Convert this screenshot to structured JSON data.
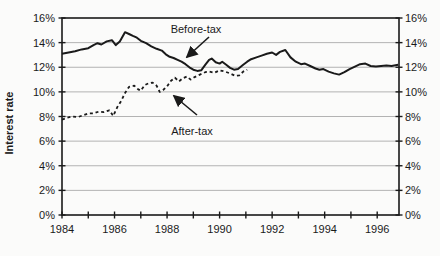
{
  "figure": {
    "background": "#fbfbfa",
    "frame_color": "#1a1a1a",
    "grid_color": "#b3b3b3",
    "line_color": "#1a1a1a"
  },
  "chart_data": {
    "type": "line",
    "title": "",
    "xlabel": "",
    "ylabel": "Interest rate",
    "xlim": [
      1984,
      1996.83
    ],
    "ylim": [
      0,
      16
    ],
    "grid": "horizontal gridlines at every 2% (light gray); full black frame; tick marks cross the axes",
    "legend": "none; series identified by in-plot text annotations with arrows",
    "y_ticks": [
      0,
      2,
      4,
      6,
      8,
      10,
      12,
      14,
      16
    ],
    "y_tick_labels": [
      "0%",
      "2%",
      "4%",
      "6%",
      "8%",
      "10%",
      "12%",
      "14%",
      "16%"
    ],
    "y_axis_sides": "both left and right",
    "x_ticks_minor": [
      1984,
      1985,
      1986,
      1987,
      1988,
      1989,
      1990,
      1991,
      1992,
      1993,
      1994,
      1995,
      1996
    ],
    "x_tick_labels": [
      "1984",
      "1986",
      "1988",
      "1990",
      "1992",
      "1994",
      "1996"
    ],
    "x_label_years": [
      1984,
      1986,
      1988,
      1990,
      1992,
      1994,
      1996
    ],
    "series": [
      {
        "name": "Before-tax",
        "style": "solid",
        "stroke_width": 2,
        "color": "#1a1a1a",
        "points": [
          [
            1984.0,
            13.1
          ],
          [
            1984.25,
            13.2
          ],
          [
            1984.5,
            13.3
          ],
          [
            1984.75,
            13.45
          ],
          [
            1985.0,
            13.55
          ],
          [
            1985.2,
            13.8
          ],
          [
            1985.35,
            13.95
          ],
          [
            1985.5,
            13.85
          ],
          [
            1985.7,
            14.1
          ],
          [
            1985.9,
            14.2
          ],
          [
            1986.05,
            13.8
          ],
          [
            1986.2,
            14.1
          ],
          [
            1986.4,
            14.85
          ],
          [
            1986.55,
            14.7
          ],
          [
            1986.7,
            14.55
          ],
          [
            1986.85,
            14.4
          ],
          [
            1987.0,
            14.15
          ],
          [
            1987.2,
            13.95
          ],
          [
            1987.4,
            13.7
          ],
          [
            1987.6,
            13.5
          ],
          [
            1987.8,
            13.35
          ],
          [
            1987.95,
            13.05
          ],
          [
            1988.1,
            12.85
          ],
          [
            1988.25,
            12.75
          ],
          [
            1988.4,
            12.6
          ],
          [
            1988.55,
            12.45
          ],
          [
            1988.7,
            12.25
          ],
          [
            1988.85,
            12.0
          ],
          [
            1989.0,
            11.8
          ],
          [
            1989.15,
            11.7
          ],
          [
            1989.3,
            11.75
          ],
          [
            1989.45,
            12.2
          ],
          [
            1989.6,
            12.6
          ],
          [
            1989.7,
            12.7
          ],
          [
            1989.85,
            12.4
          ],
          [
            1990.0,
            12.3
          ],
          [
            1990.1,
            12.45
          ],
          [
            1990.25,
            12.2
          ],
          [
            1990.4,
            11.95
          ],
          [
            1990.55,
            11.8
          ],
          [
            1990.7,
            11.85
          ],
          [
            1990.9,
            12.2
          ],
          [
            1991.05,
            12.45
          ],
          [
            1991.2,
            12.65
          ],
          [
            1991.4,
            12.8
          ],
          [
            1991.6,
            12.95
          ],
          [
            1991.8,
            13.1
          ],
          [
            1992.0,
            13.2
          ],
          [
            1992.15,
            13.0
          ],
          [
            1992.3,
            13.25
          ],
          [
            1992.5,
            13.4
          ],
          [
            1992.7,
            12.8
          ],
          [
            1992.9,
            12.45
          ],
          [
            1993.1,
            12.25
          ],
          [
            1993.25,
            12.3
          ],
          [
            1993.45,
            12.1
          ],
          [
            1993.65,
            11.9
          ],
          [
            1993.8,
            11.8
          ],
          [
            1993.95,
            11.85
          ],
          [
            1994.15,
            11.65
          ],
          [
            1994.35,
            11.5
          ],
          [
            1994.55,
            11.4
          ],
          [
            1994.75,
            11.6
          ],
          [
            1994.95,
            11.85
          ],
          [
            1995.15,
            12.05
          ],
          [
            1995.35,
            12.25
          ],
          [
            1995.55,
            12.3
          ],
          [
            1995.75,
            12.1
          ],
          [
            1995.95,
            12.05
          ],
          [
            1996.15,
            12.1
          ],
          [
            1996.35,
            12.15
          ],
          [
            1996.55,
            12.1
          ],
          [
            1996.8,
            12.2
          ]
        ]
      },
      {
        "name": "After-tax",
        "style": "dashed",
        "stroke_width": 1.8,
        "color": "#1a1a1a",
        "points": [
          [
            1984.0,
            7.75
          ],
          [
            1984.2,
            7.9
          ],
          [
            1984.4,
            8.0
          ],
          [
            1984.6,
            7.95
          ],
          [
            1984.8,
            8.1
          ],
          [
            1985.0,
            8.25
          ],
          [
            1985.2,
            8.25
          ],
          [
            1985.4,
            8.4
          ],
          [
            1985.6,
            8.35
          ],
          [
            1985.8,
            8.5
          ],
          [
            1985.95,
            8.05
          ],
          [
            1986.1,
            8.75
          ],
          [
            1986.25,
            9.25
          ],
          [
            1986.4,
            9.9
          ],
          [
            1986.55,
            10.4
          ],
          [
            1986.75,
            10.5
          ],
          [
            1986.9,
            10.2
          ],
          [
            1987.0,
            10.1
          ],
          [
            1987.15,
            10.55
          ],
          [
            1987.3,
            10.7
          ],
          [
            1987.45,
            10.75
          ],
          [
            1987.6,
            10.5
          ],
          [
            1987.72,
            10.0
          ],
          [
            1987.85,
            10.15
          ],
          [
            1988.0,
            10.45
          ],
          [
            1988.15,
            10.9
          ],
          [
            1988.3,
            11.15
          ],
          [
            1988.45,
            10.85
          ],
          [
            1988.6,
            11.1
          ],
          [
            1988.75,
            11.25
          ],
          [
            1988.9,
            11.0
          ],
          [
            1989.05,
            11.2
          ],
          [
            1989.25,
            11.4
          ],
          [
            1989.45,
            11.6
          ],
          [
            1989.6,
            11.65
          ],
          [
            1989.8,
            11.55
          ],
          [
            1990.0,
            11.75
          ],
          [
            1990.2,
            11.65
          ],
          [
            1990.4,
            11.5
          ],
          [
            1990.6,
            11.3
          ],
          [
            1990.75,
            11.35
          ],
          [
            1990.9,
            11.65
          ],
          [
            1991.05,
            11.8
          ]
        ]
      }
    ],
    "annotations": [
      {
        "id": "before-tax",
        "text": "Before-tax",
        "label_x": 196,
        "label_y": 33,
        "arrow_from": [
          209,
          37
        ],
        "arrow_to": [
          187,
          57
        ]
      },
      {
        "id": "after-tax",
        "text": "After-tax",
        "label_x": 192,
        "label_y": 135,
        "arrow_from": [
          197,
          115
        ],
        "arrow_to": [
          174,
          96
        ]
      }
    ]
  }
}
